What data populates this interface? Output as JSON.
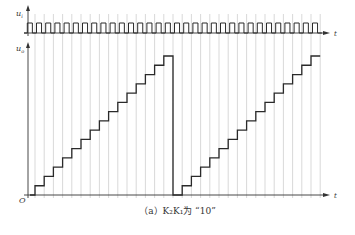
{
  "figure": {
    "caption": "（a）K₂K₁为 “10”",
    "clock_axis_label": "u",
    "clock_axis_sub": "i",
    "output_axis_label": "u",
    "output_axis_sub": "o",
    "time_label": "t",
    "origin_label": "O",
    "colors": {
      "trace": "#2a2a2a",
      "grid": "#c8c8c8",
      "axis": "#333333"
    }
  },
  "chart_data": {
    "type": "line",
    "title": "（a）K₂K₁为 “10”",
    "xlabel": "t",
    "series": [
      {
        "name": "u_i (clock)",
        "kind": "square-wave",
        "pulse_count": 32
      },
      {
        "name": "u_o (staircase output)",
        "kind": "step",
        "levels": [
          1,
          2,
          3,
          4,
          5,
          6,
          7,
          8,
          9,
          10,
          11,
          12,
          13,
          14,
          15,
          0,
          1,
          2,
          3,
          4,
          5,
          6,
          7,
          8,
          9,
          10,
          11,
          12,
          13,
          14,
          15
        ],
        "initial_level": 0,
        "max_level": 15
      }
    ],
    "grid": "vertical lines at clock periods"
  }
}
